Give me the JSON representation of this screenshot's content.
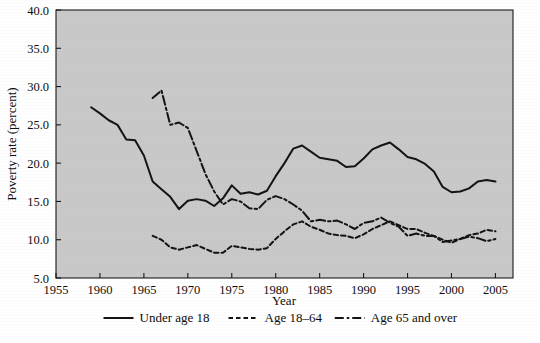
{
  "chart_data": {
    "type": "line",
    "title": "",
    "subtitle": "",
    "xlabel": "Year",
    "ylabel": "Poverty rate (percent)",
    "xlim": [
      1955,
      2007
    ],
    "ylim": [
      5.0,
      40.0
    ],
    "xticks": [
      1955,
      1960,
      1965,
      1970,
      1975,
      1980,
      1985,
      1990,
      1995,
      2000,
      2005
    ],
    "xtick_labels": [
      "1955",
      "1960",
      "1965",
      "1970",
      "1975",
      "1980",
      "1985",
      "1990",
      "1995",
      "2000",
      "2005"
    ],
    "yticks": [
      5.0,
      10.0,
      15.0,
      20.0,
      25.0,
      30.0,
      35.0,
      40.0
    ],
    "ytick_labels": [
      "5.0",
      "10.0",
      "15.0",
      "20.0",
      "25.0",
      "30.0",
      "35.0",
      "40.0"
    ],
    "grid": false,
    "legend_position": "below",
    "plot_background": "#c9c9c9",
    "line_color": "#141414",
    "series": [
      {
        "name": "Under age 18",
        "style": "solid",
        "x": [
          1959,
          1960,
          1961,
          1962,
          1963,
          1964,
          1965,
          1966,
          1967,
          1968,
          1969,
          1970,
          1971,
          1972,
          1973,
          1974,
          1975,
          1976,
          1977,
          1978,
          1979,
          1980,
          1981,
          1982,
          1983,
          1984,
          1985,
          1986,
          1987,
          1988,
          1989,
          1990,
          1991,
          1992,
          1993,
          1994,
          1995,
          1996,
          1997,
          1998,
          1999,
          2000,
          2001,
          2002,
          2003,
          2004,
          2005
        ],
        "y": [
          27.3,
          26.5,
          25.6,
          25.0,
          23.1,
          23.0,
          21.0,
          17.6,
          16.6,
          15.6,
          14.0,
          15.1,
          15.3,
          15.1,
          14.4,
          15.4,
          17.1,
          16.0,
          16.2,
          15.9,
          16.4,
          18.3,
          20.0,
          21.9,
          22.3,
          21.5,
          20.7,
          20.5,
          20.3,
          19.5,
          19.6,
          20.6,
          21.8,
          22.3,
          22.7,
          21.8,
          20.8,
          20.5,
          19.9,
          18.9,
          16.9,
          16.2,
          16.3,
          16.7,
          17.6,
          17.8,
          17.6
        ]
      },
      {
        "name": "Age 18–64",
        "style": "dashed",
        "x": [
          1966,
          1967,
          1968,
          1969,
          1970,
          1971,
          1972,
          1973,
          1974,
          1975,
          1976,
          1977,
          1978,
          1979,
          1980,
          1981,
          1982,
          1983,
          1984,
          1985,
          1986,
          1987,
          1988,
          1989,
          1990,
          1991,
          1992,
          1993,
          1994,
          1995,
          1996,
          1997,
          1998,
          1999,
          2000,
          2001,
          2002,
          2003,
          2004,
          2005
        ],
        "y": [
          10.5,
          10.0,
          9.0,
          8.7,
          9.0,
          9.3,
          8.8,
          8.3,
          8.3,
          9.2,
          9.0,
          8.8,
          8.7,
          8.9,
          10.1,
          11.1,
          12.0,
          12.4,
          11.7,
          11.3,
          10.8,
          10.6,
          10.5,
          10.2,
          10.7,
          11.4,
          11.9,
          12.4,
          11.9,
          11.4,
          11.4,
          10.9,
          10.5,
          10.0,
          9.6,
          10.1,
          10.6,
          10.8,
          11.3,
          11.1
        ]
      },
      {
        "name": "Age 65 and over",
        "style": "dashdot",
        "x": [
          1966,
          1967,
          1968,
          1969,
          1970,
          1971,
          1972,
          1973,
          1974,
          1975,
          1976,
          1977,
          1978,
          1979,
          1980,
          1981,
          1982,
          1983,
          1984,
          1985,
          1986,
          1987,
          1988,
          1989,
          1990,
          1991,
          1992,
          1993,
          1994,
          1995,
          1996,
          1997,
          1998,
          1999,
          2000,
          2001,
          2002,
          2003,
          2004,
          2005
        ],
        "y": [
          28.5,
          29.5,
          25.0,
          25.3,
          24.6,
          21.6,
          18.6,
          16.3,
          14.6,
          15.3,
          15.0,
          14.1,
          14.0,
          15.2,
          15.7,
          15.3,
          14.6,
          13.8,
          12.4,
          12.6,
          12.4,
          12.5,
          12.0,
          11.4,
          12.2,
          12.4,
          12.9,
          12.2,
          11.7,
          10.5,
          10.8,
          10.5,
          10.5,
          9.7,
          9.9,
          10.1,
          10.4,
          10.2,
          9.8,
          10.1
        ]
      }
    ],
    "legend": [
      {
        "label": "Under age 18",
        "style": "solid"
      },
      {
        "label": "Age 18–64",
        "style": "dashed"
      },
      {
        "label": "Age 65 and over",
        "style": "dashdot"
      }
    ]
  }
}
